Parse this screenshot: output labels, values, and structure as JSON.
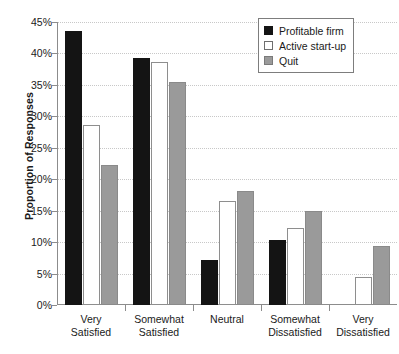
{
  "chart_data": {
    "type": "bar",
    "title": "",
    "xlabel": "",
    "ylabel": "Proportion of Responses",
    "ylim": [
      0,
      45
    ],
    "ytick_labels": [
      "0%",
      "5%",
      "10%",
      "15%",
      "20%",
      "25%",
      "30%",
      "35%",
      "40%",
      "45%"
    ],
    "ytick_values": [
      0,
      5,
      10,
      15,
      20,
      25,
      30,
      35,
      40,
      45
    ],
    "grid": true,
    "legend_position": "top-right",
    "categories": [
      "Very Satisfied",
      "Somewhat Satisfied",
      "Neutral",
      "Somewhat Dissatisfied",
      "Very Dissatisfied"
    ],
    "category_lines": [
      [
        "Very",
        "Satisfied"
      ],
      [
        "Somewhat",
        "Satisfied"
      ],
      [
        "Neutral",
        ""
      ],
      [
        "Somewhat",
        "Dissatisfied"
      ],
      [
        "Very",
        "Dissatisfied"
      ]
    ],
    "series": [
      {
        "name": "Profitable firm",
        "color": "#141414",
        "style": "filled-black",
        "values": [
          43.5,
          39.3,
          7.2,
          10.3,
          0
        ]
      },
      {
        "name": "Active start-up",
        "color": "#ffffff",
        "style": "outlined-white",
        "values": [
          28.7,
          38.6,
          16.6,
          12.2,
          4.5
        ]
      },
      {
        "name": "Quit",
        "color": "#9a9a9a",
        "style": "filled-gray",
        "values": [
          22.3,
          35.4,
          18.1,
          15.0,
          9.4
        ]
      }
    ]
  },
  "legend": {
    "items": [
      {
        "label": "Profitable firm",
        "swatch": "legend-swatch-profitable-firm"
      },
      {
        "label": "Active start-up",
        "swatch": "legend-swatch-active-start-up"
      },
      {
        "label": "Quit",
        "swatch": "legend-swatch-quit"
      }
    ]
  },
  "colors": {
    "profitable_firm": "#141414",
    "active_start_up": "#ffffff",
    "quit": "#9a9a9a",
    "axis": "#8c8c8c",
    "gridline": "#c8c8c8",
    "background": "#ffffff"
  }
}
